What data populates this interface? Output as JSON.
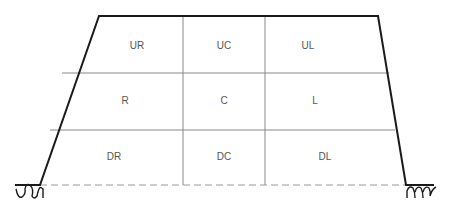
{
  "diagram": {
    "type": "zone-grid-on-trapezoid",
    "colors": {
      "outline": "#1a1a1a",
      "grid": "#888888",
      "label": "#555555",
      "dashed": "#999999"
    },
    "zones": [
      [
        "UR",
        "UC",
        "UL"
      ],
      [
        "R",
        "C",
        "L"
      ],
      [
        "DR",
        "DC",
        "DL"
      ]
    ],
    "ground_symbols": [
      "left-ground-wave",
      "right-ground-wave"
    ]
  }
}
